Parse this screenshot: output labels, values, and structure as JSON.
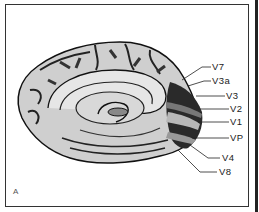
{
  "figure": {
    "panel_label": "A",
    "labels": [
      {
        "id": "v7",
        "text": "V7",
        "x": 212,
        "y": 63
      },
      {
        "id": "v3a",
        "text": "V3a",
        "x": 212,
        "y": 77
      },
      {
        "id": "v3",
        "text": "V3",
        "x": 226,
        "y": 91
      },
      {
        "id": "v2",
        "text": "V2",
        "x": 230,
        "y": 104
      },
      {
        "id": "v1",
        "text": "V1",
        "x": 230,
        "y": 117
      },
      {
        "id": "vp",
        "text": "VP",
        "x": 230,
        "y": 133
      },
      {
        "id": "v4",
        "text": "V4",
        "x": 222,
        "y": 151
      },
      {
        "id": "v8",
        "text": "V8",
        "x": 219,
        "y": 167
      }
    ]
  }
}
